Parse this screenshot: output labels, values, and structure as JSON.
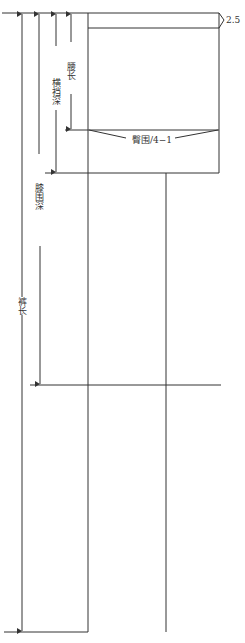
{
  "diagram": {
    "type": "trouser-front-pattern-draft",
    "labels": {
      "waist_band": "2.5",
      "hip_length": "腰长",
      "crotch_depth": "横裆深",
      "knee_depth": "膝围深",
      "trouser_length": "裤长",
      "hip_measure": "臀围/4−1"
    },
    "colors": {
      "line": "#333333",
      "background": "#ffffff"
    }
  }
}
